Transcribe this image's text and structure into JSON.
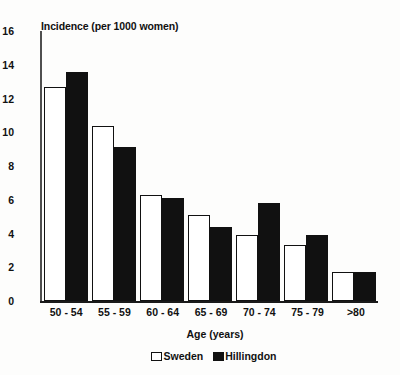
{
  "chart_data": {
    "type": "bar",
    "title": "",
    "subtitle": "",
    "xlabel": "Age (years)",
    "ylabel": "Incidence (per 1000 women)",
    "categories": [
      "50 - 54",
      "55 - 59",
      "60 - 64",
      "65 - 69",
      "70 - 74",
      "75 - 79",
      ">80"
    ],
    "series": [
      {
        "name": "Sweden",
        "values": [
          12.7,
          10.4,
          6.3,
          5.1,
          3.9,
          3.3,
          1.7
        ],
        "color": "#ffffff"
      },
      {
        "name": "Hillingdon",
        "values": [
          13.6,
          9.1,
          6.1,
          4.4,
          5.8,
          3.9,
          1.7
        ],
        "color": "#111111"
      }
    ],
    "ylim": [
      0,
      16
    ],
    "ytick_values": [
      0,
      2,
      4,
      6,
      8,
      10,
      12,
      14,
      16
    ],
    "ytick_labels": [
      "0",
      "2",
      "4",
      "6",
      "8",
      "10",
      "12",
      "14",
      "16"
    ],
    "grid": false,
    "legend_position": "bottom-center",
    "legend": [
      {
        "label": "Sweden",
        "swatch": "hollow-square"
      },
      {
        "label": "Hillingdon",
        "swatch": "filled-square"
      }
    ],
    "axis_color": "#1a1a1a",
    "background_color": "#fdfdfc"
  }
}
